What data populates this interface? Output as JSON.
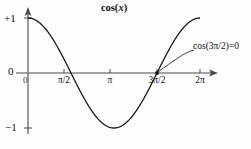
{
  "chart_data": {
    "type": "line",
    "title": "cos(x)",
    "xlabel": "",
    "ylabel": "",
    "xlim": [
      0,
      6.283185307179586
    ],
    "ylim": [
      -1,
      1
    ],
    "grid": false,
    "legend": null,
    "x_tick_labels": [
      "0",
      "π/2",
      "π",
      "3π/2",
      "2π"
    ],
    "x_tick_values": [
      0,
      1.5707963,
      3.1415927,
      4.712389,
      6.2831853
    ],
    "y_tick_labels": [
      "+1",
      "0",
      "−1"
    ],
    "y_tick_values": [
      1,
      0,
      -1
    ],
    "series": [
      {
        "name": "cos(x)",
        "x": [
          0,
          0.3926991,
          0.7853982,
          1.1780972,
          1.5707963,
          1.9634954,
          2.3561945,
          2.7488936,
          3.1415927,
          3.5342917,
          3.9269908,
          4.3196899,
          4.712389,
          5.1050881,
          5.4977871,
          5.8904862,
          6.2831853
        ],
        "values": [
          1.0,
          0.9239,
          0.7071,
          0.3827,
          0.0,
          -0.3827,
          -0.7071,
          -0.9239,
          -1.0,
          -0.9239,
          -0.7071,
          -0.3827,
          0.0,
          0.3827,
          0.7071,
          0.9239,
          1.0
        ]
      }
    ],
    "annotations": [
      {
        "text": "cos(3π/2)=0",
        "points_to_x": 4.712389,
        "points_to_y": 0
      }
    ],
    "colors": {
      "curve": "#1a1a1a",
      "axis": "#4a4a4a",
      "text": "#121212",
      "background": "#fdfdfd"
    }
  },
  "chart": {
    "title": "cos(x)",
    "title_fn": "cos(",
    "title_var": "x",
    "title_close": ")",
    "annotation": "cos(3π/2)=0",
    "y_labels": {
      "pos1": "+1",
      "zero": "0",
      "neg1": "−1",
      "origin": "0"
    },
    "x_labels": {
      "pi_over_2": "π/2",
      "pi": "π",
      "three_pi_over_2": "3π/2",
      "two_pi": "2π"
    }
  }
}
